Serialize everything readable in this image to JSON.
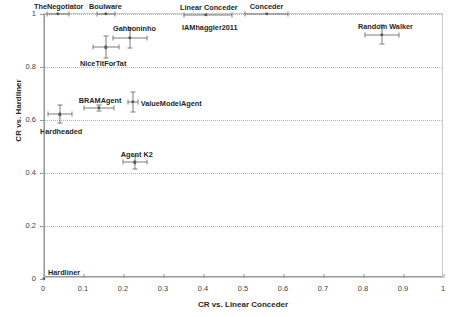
{
  "chart_data": {
    "type": "scatter",
    "title": "",
    "xlabel": "CR vs. Linear Conceder",
    "ylabel": "CR vs. Hardliner",
    "xlim": [
      0,
      1
    ],
    "ylim": [
      0,
      1
    ],
    "xticks": [
      "0",
      "0.1",
      "0.2",
      "0.3",
      "0.4",
      "0.5",
      "0.6",
      "0.7",
      "0.8",
      "0.9",
      "1"
    ],
    "xtick_values": [
      0,
      0.1,
      0.2,
      0.3,
      0.4,
      0.5,
      0.6,
      0.7,
      0.8,
      0.9,
      1
    ],
    "yticks": [
      "0",
      "0.2",
      "0.4",
      "0.6",
      "0.8",
      "1"
    ],
    "ytick_values": [
      0,
      0.2,
      0.4,
      0.6,
      0.8,
      1
    ],
    "grid": "horizontal-dotted",
    "legend": "none",
    "marker_color": "#5a5a5a",
    "errorbar_color": "#7c7c7c",
    "points": [
      {
        "label": "TheNegotiator",
        "x": 0.035,
        "y": 1.0,
        "xerr_low": 0.028,
        "xerr_high": 0.028,
        "yerr_low": 0.0,
        "yerr_high": 0.0,
        "label_dx": -24,
        "label_dy": -12
      },
      {
        "label": "Boulware",
        "x": 0.155,
        "y": 1.0,
        "xerr_low": 0.022,
        "xerr_high": 0.022,
        "yerr_low": 0.0,
        "yerr_high": 0.0,
        "label_dx": -17,
        "label_dy": -12
      },
      {
        "label": "Linear Conceder",
        "x": 0.405,
        "y": 0.998,
        "xerr_low": 0.055,
        "xerr_high": 0.065,
        "yerr_low": 0.0,
        "yerr_high": 0.0,
        "label_dx": -26,
        "label_dy": -12
      },
      {
        "label": "Conceder",
        "x": 0.557,
        "y": 1.0,
        "xerr_low": 0.055,
        "xerr_high": 0.052,
        "yerr_low": 0.0,
        "yerr_high": 0.0,
        "label_dx": -17,
        "label_dy": -12
      },
      {
        "label": "IAMhaggler2011",
        "x": 0.405,
        "y": 0.998,
        "xerr_low": 0.0,
        "xerr_high": 0.0,
        "yerr_low": 0.0,
        "yerr_high": 0.0,
        "label_dx": -24,
        "label_dy": 8,
        "marker_hidden": true
      },
      {
        "label": "Random Walker",
        "x": 0.845,
        "y": 0.922,
        "xerr_low": 0.043,
        "xerr_high": 0.043,
        "yerr_low": 0.035,
        "yerr_high": 0.035,
        "label_dx": -24,
        "label_dy": -13
      },
      {
        "label": "Gahboninho",
        "x": 0.215,
        "y": 0.91,
        "xerr_low": 0.042,
        "xerr_high": 0.042,
        "yerr_low": 0.038,
        "yerr_high": 0.038,
        "label_dx": -17,
        "label_dy": -14
      },
      {
        "label": "NiceTitForTat",
        "x": 0.155,
        "y": 0.875,
        "xerr_low": 0.032,
        "xerr_high": 0.032,
        "yerr_low": 0.042,
        "yerr_high": 0.042,
        "label_dx": -26,
        "label_dy": 12
      },
      {
        "label": "ValueModelAgent",
        "x": 0.222,
        "y": 0.668,
        "xerr_low": 0.012,
        "xerr_high": 0.012,
        "yerr_low": 0.038,
        "yerr_high": 0.038,
        "label_dx": 8,
        "label_dy": -3
      },
      {
        "label": "BRAMAgent",
        "x": 0.137,
        "y": 0.645,
        "xerr_low": 0.038,
        "xerr_high": 0.038,
        "yerr_low": 0.012,
        "yerr_high": 0.012,
        "label_dx": -20,
        "label_dy": -12
      },
      {
        "label": "Hardheaded",
        "x": 0.04,
        "y": 0.622,
        "xerr_low": 0.03,
        "xerr_high": 0.03,
        "yerr_low": 0.035,
        "yerr_high": 0.035,
        "label_dx": -20,
        "label_dy": 13
      },
      {
        "label": "Agent K2",
        "x": 0.227,
        "y": 0.44,
        "xerr_low": 0.03,
        "xerr_high": 0.03,
        "yerr_low": 0.025,
        "yerr_high": 0.025,
        "label_dx": -14,
        "label_dy": -12
      },
      {
        "label": "Hardliner",
        "x": 0.0,
        "y": 0.0,
        "xerr_low": 0.0,
        "xerr_high": 0.0,
        "yerr_low": 0.0,
        "yerr_high": 0.0,
        "label_dx": 4,
        "label_dy": -11
      }
    ]
  }
}
